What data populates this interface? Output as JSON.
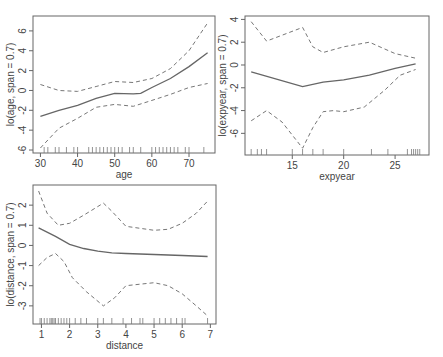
{
  "chart_data": [
    {
      "type": "line",
      "title": "",
      "xlabel": "age",
      "ylabel": "lo(age, span = 0.7)",
      "xlim": [
        28,
        77
      ],
      "ylim": [
        -6.3,
        7.5
      ],
      "xticks": [
        30,
        40,
        50,
        60,
        70
      ],
      "yticks": [
        -6,
        -4,
        -2,
        0,
        2,
        4,
        6
      ],
      "grid": false,
      "series": [
        {
          "name": "fit",
          "style": "solid",
          "x": [
            30,
            35,
            40,
            45,
            50,
            55,
            57,
            60,
            65,
            70,
            75
          ],
          "y": [
            -2.6,
            -2.0,
            -1.5,
            -0.8,
            -0.3,
            -0.35,
            -0.3,
            0.3,
            1.2,
            2.4,
            3.8
          ]
        },
        {
          "name": "upper",
          "style": "dashed",
          "x": [
            30,
            35,
            40,
            45,
            50,
            55,
            60,
            65,
            70,
            75
          ],
          "y": [
            0.6,
            0.0,
            -0.1,
            0.4,
            0.9,
            0.8,
            1.2,
            2.2,
            4.0,
            6.8
          ]
        },
        {
          "name": "lower",
          "style": "dashed",
          "x": [
            30,
            35,
            40,
            45,
            50,
            55,
            60,
            65,
            70,
            75
          ],
          "y": [
            -5.8,
            -3.8,
            -2.8,
            -1.7,
            -1.4,
            -1.6,
            -1.0,
            -0.4,
            0.3,
            0.7
          ]
        }
      ],
      "rug": [
        31,
        32,
        34,
        35,
        37,
        39,
        40,
        43,
        44,
        45,
        46,
        47,
        48,
        49,
        50,
        51,
        52,
        54,
        55,
        57,
        60,
        61,
        62,
        63,
        64,
        65,
        66,
        67,
        69,
        70,
        74
      ]
    },
    {
      "type": "line",
      "title": "",
      "xlabel": "expyear",
      "ylabel": "lo(expyear, span = 0.7)",
      "xlim": [
        10.4,
        28.3
      ],
      "ylim": [
        -7.9,
        4.3
      ],
      "xticks": [
        15,
        20,
        25
      ],
      "yticks": [
        -6,
        -4,
        -2,
        0,
        2,
        4
      ],
      "grid": false,
      "series": [
        {
          "name": "fit",
          "style": "solid",
          "x": [
            11,
            16,
            18,
            20,
            22.5,
            25,
            27
          ],
          "y": [
            -0.6,
            -1.9,
            -1.5,
            -1.3,
            -0.9,
            -0.3,
            0.1
          ]
        },
        {
          "name": "upper",
          "style": "dashed",
          "x": [
            11,
            12.5,
            16,
            17,
            18,
            20,
            22.5,
            25,
            27
          ],
          "y": [
            3.8,
            2.1,
            3.3,
            1.6,
            1.1,
            1.6,
            2.0,
            1.0,
            0.6
          ]
        },
        {
          "name": "lower",
          "style": "dashed",
          "x": [
            11,
            12.5,
            14,
            16,
            17,
            18,
            19,
            20,
            22,
            24,
            25.5,
            27
          ],
          "y": [
            -4.9,
            -4.0,
            -5.0,
            -7.3,
            -5.5,
            -4.1,
            -4.0,
            -4.1,
            -3.7,
            -2.2,
            -0.9,
            -0.4
          ]
        }
      ],
      "rug": [
        11,
        11.6,
        12,
        12.5,
        15,
        16,
        17,
        18,
        20,
        22.7,
        24.3,
        26.2,
        26.6,
        26.8,
        27,
        27.2,
        27.4
      ]
    },
    {
      "type": "line",
      "title": "",
      "xlabel": "distance",
      "ylabel": "lo(distance, span = 0.7)",
      "xlim": [
        0.7,
        7.2
      ],
      "ylim": [
        -3.9,
        3.0
      ],
      "xticks": [
        1,
        2,
        3,
        4,
        5,
        6,
        7
      ],
      "yticks": [
        -3,
        -2,
        -1,
        0,
        1,
        2
      ],
      "grid": false,
      "series": [
        {
          "name": "fit",
          "style": "solid",
          "x": [
            0.9,
            1.5,
            2,
            2.5,
            3,
            3.5,
            4,
            5,
            6,
            6.9
          ],
          "y": [
            0.87,
            0.45,
            0.05,
            -0.15,
            -0.28,
            -0.37,
            -0.4,
            -0.45,
            -0.5,
            -0.55
          ]
        },
        {
          "name": "upper",
          "style": "dashed",
          "x": [
            0.9,
            1.2,
            1.6,
            2,
            2.5,
            3.2,
            3.5,
            4,
            5,
            5.5,
            6,
            6.5,
            6.9
          ],
          "y": [
            2.7,
            1.6,
            1.0,
            1.1,
            1.5,
            2.1,
            1.7,
            0.95,
            0.75,
            0.8,
            1.1,
            1.6,
            2.2
          ]
        },
        {
          "name": "lower",
          "style": "dashed",
          "x": [
            0.9,
            1.2,
            1.5,
            1.8,
            2.1,
            2.6,
            3.2,
            3.6,
            4,
            5,
            5.5,
            6,
            6.5,
            6.9
          ],
          "y": [
            -1.0,
            -0.6,
            -0.4,
            -0.8,
            -1.6,
            -2.3,
            -3.0,
            -2.6,
            -2.0,
            -1.85,
            -2.0,
            -2.4,
            -3.0,
            -3.5
          ]
        }
      ],
      "rug": [
        0.95,
        1.0,
        1.1,
        1.2,
        1.3,
        1.35,
        1.4,
        1.45,
        1.5,
        1.6,
        1.7,
        1.8,
        1.9,
        2.0,
        2.2,
        2.4,
        2.6,
        3.0,
        3.2,
        3.5,
        3.9,
        4.2,
        4.5,
        4.6,
        5.0,
        5.2,
        5.4,
        5.6,
        5.8,
        6.0,
        6.1,
        6.9
      ]
    }
  ]
}
